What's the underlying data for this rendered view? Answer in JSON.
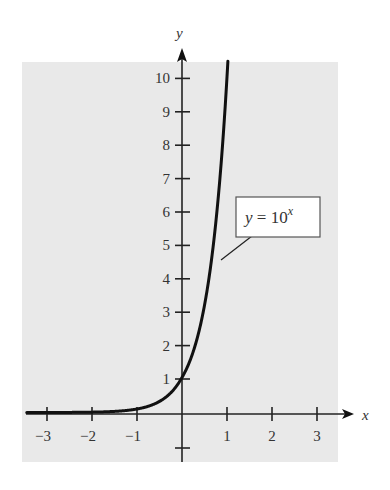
{
  "chart_data": {
    "type": "line",
    "title": "",
    "xlabel": "x",
    "ylabel": "y",
    "xlim": [
      -3.4,
      3.7
    ],
    "ylim": [
      -1.3,
      10.5
    ],
    "x_ticks": [
      -3,
      -2,
      -1,
      1,
      2,
      3
    ],
    "x_tick_labels": [
      "−3",
      "−2",
      "−1",
      "1",
      "2",
      "3"
    ],
    "y_ticks": [
      1,
      2,
      3,
      4,
      5,
      6,
      7,
      8,
      9,
      10
    ],
    "y_tick_labels": [
      "1",
      "2",
      "3",
      "4",
      "5",
      "6",
      "7",
      "8",
      "9",
      "10"
    ],
    "extra_y_tick_unlabeled": [
      -1
    ],
    "grid": false,
    "background": "#e9e9e9",
    "series": [
      {
        "name": "y = 10^x",
        "function": "10^x",
        "color": "#111111",
        "x": [
          -3.4,
          -3,
          -2,
          -1,
          -0.5,
          0,
          0.3,
          0.5,
          0.7,
          0.8,
          0.9,
          1.0
        ],
        "y": [
          0.0004,
          0.001,
          0.01,
          0.1,
          0.316,
          1,
          1.995,
          3.162,
          5.012,
          6.31,
          7.943,
          10
        ]
      }
    ],
    "annotations": [
      {
        "text_main": "y = 10",
        "text_sup": "x",
        "points_to": [
          0.85,
          7.1
        ]
      }
    ]
  }
}
